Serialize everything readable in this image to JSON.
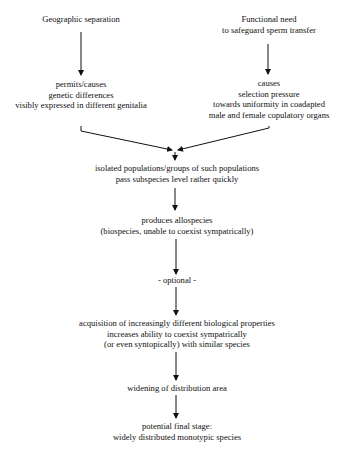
{
  "diagram": {
    "left_branch": {
      "cause": [
        "Geographic separation"
      ],
      "effect": [
        "permits/causes",
        "genetic differences",
        "visibly expressed in different genitalia"
      ]
    },
    "right_branch": {
      "cause": [
        "Functional need",
        "to safeguard sperm transfer"
      ],
      "effect": [
        "causes",
        "selection pressure",
        "towards uniformity in coadapted",
        "male and female copulatory organs"
      ]
    },
    "steps": [
      [
        "isolated populations/groups of such populations",
        "pass subspecies level rather quickly"
      ],
      [
        "produces allospecies",
        "(biospecies, unable to coexist sympatrically)"
      ],
      [
        "- optional -"
      ],
      [
        "acquisition of increasingly different biological properties",
        "increases ability to coexist sympatrically",
        "(or even syntopically) with similar species"
      ],
      [
        "widening of distribution area"
      ],
      [
        "potential final stage:",
        "widely distributed monotypic species"
      ]
    ],
    "colors": {
      "text": "#111111",
      "arrow": "#111111",
      "background": "#ffffff"
    }
  }
}
